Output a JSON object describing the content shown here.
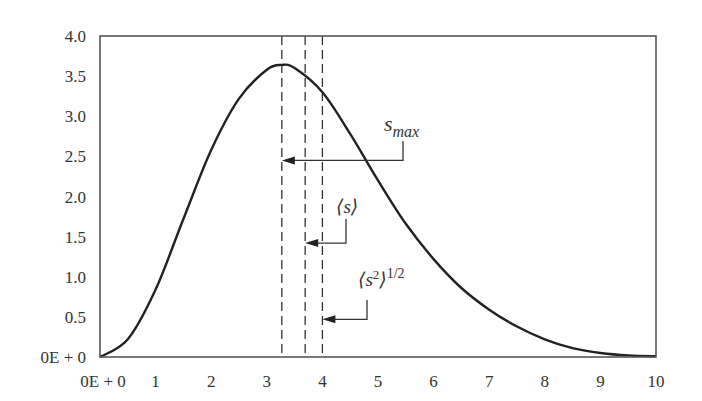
{
  "chart_data": {
    "type": "line",
    "title": "",
    "xlabel": "",
    "ylabel": "",
    "xlim": [
      0,
      10
    ],
    "ylim": [
      0,
      4.0
    ],
    "grid": false,
    "legend": null,
    "x_ticks": [
      {
        "value": 0,
        "label": "0E + 0"
      },
      {
        "value": 1,
        "label": "1"
      },
      {
        "value": 2,
        "label": "2"
      },
      {
        "value": 3,
        "label": "3"
      },
      {
        "value": 4,
        "label": "4"
      },
      {
        "value": 5,
        "label": "5"
      },
      {
        "value": 6,
        "label": "6"
      },
      {
        "value": 7,
        "label": "7"
      },
      {
        "value": 8,
        "label": "8"
      },
      {
        "value": 9,
        "label": "9"
      },
      {
        "value": 10,
        "label": "10"
      }
    ],
    "y_ticks": [
      {
        "value": 0,
        "label": "0E + 0"
      },
      {
        "value": 0.5,
        "label": "0.5"
      },
      {
        "value": 1.0,
        "label": "1.0"
      },
      {
        "value": 1.5,
        "label": "1.5"
      },
      {
        "value": 2.0,
        "label": "2.0"
      },
      {
        "value": 2.5,
        "label": "2.5"
      },
      {
        "value": 3.0,
        "label": "3.0"
      },
      {
        "value": 3.5,
        "label": "3.5"
      },
      {
        "value": 4.0,
        "label": "4.0"
      }
    ],
    "series": [
      {
        "name": "distribution",
        "x": [
          0,
          0.5,
          1,
          1.5,
          2,
          2.5,
          3,
          3.27,
          3.5,
          4,
          4.5,
          5,
          5.5,
          6,
          6.5,
          7,
          7.5,
          8,
          8.5,
          9,
          9.5,
          10
        ],
        "y": [
          0,
          0.22,
          0.84,
          1.72,
          2.58,
          3.22,
          3.58,
          3.64,
          3.6,
          3.3,
          2.78,
          2.2,
          1.66,
          1.22,
          0.86,
          0.59,
          0.38,
          0.22,
          0.11,
          0.05,
          0.02,
          0.01
        ]
      }
    ],
    "markers": [
      {
        "id": "s_max",
        "x": 3.27,
        "label_main": "s",
        "label_sub": "max",
        "label_x": 6.3,
        "label_y": 2.96,
        "arrow_y": 2.45
      },
      {
        "id": "mean_s",
        "x": 3.69,
        "label_main": "⟨s⟩",
        "label_sup": "",
        "label_x": 4.52,
        "label_y": 1.72,
        "arrow_y": 1.42
      },
      {
        "id": "rms_s",
        "x": 4.0,
        "label_main": "⟨s",
        "label_sup_inner": "2",
        "label_close": "⟩",
        "label_sup": "1/2",
        "label_x": 4.6,
        "label_y": 1.1,
        "arrow_y": 0.47
      }
    ]
  }
}
